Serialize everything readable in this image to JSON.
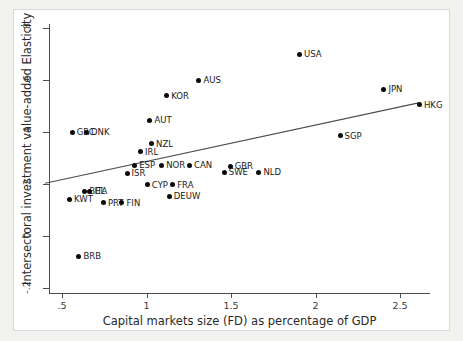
{
  "chart_data": {
    "type": "scatter",
    "title": "",
    "xlabel": "Capital markets size (FD) as percentage of GDP",
    "ylabel": "Intersectoral investment value-added Elasticity",
    "xlim": [
      0.37,
      2.72
    ],
    "ylim": [
      -0.24,
      0.84
    ],
    "xticks": [
      0.5,
      1,
      1.5,
      2,
      2.5
    ],
    "xticklabels": [
      ".5",
      "1",
      "1.5",
      "2",
      "2.5"
    ],
    "yticks": [
      -0.2,
      0,
      0.2,
      0.4,
      0.6,
      0.8
    ],
    "yticklabels": [
      "-.2",
      "0",
      ".2",
      ".4",
      ".6",
      ".8"
    ],
    "grid": false,
    "legend": false,
    "marker_color": "#0a0a0a",
    "fit_line_color": "#4d4d4d",
    "fit_line": {
      "x0": 0.4,
      "y0": 0.203,
      "x1": 2.61,
      "y1": 0.512
    },
    "points": [
      {
        "label": "GRC",
        "x": 0.56,
        "y": 0.4,
        "lx": "right"
      },
      {
        "label": "DNK",
        "x": 0.645,
        "y": 0.4,
        "lx": "right"
      },
      {
        "label": "AUS",
        "x": 1.31,
        "y": 0.6,
        "lx": "right"
      },
      {
        "label": "KOR",
        "x": 1.12,
        "y": 0.54,
        "lx": "right"
      },
      {
        "label": "AUT",
        "x": 1.02,
        "y": 0.445,
        "lx": "right"
      },
      {
        "label": "NZL",
        "x": 1.03,
        "y": 0.355,
        "lx": "right"
      },
      {
        "label": "IRL",
        "x": 0.965,
        "y": 0.325,
        "lx": "right"
      },
      {
        "label": "ESP",
        "x": 0.93,
        "y": 0.272,
        "lx": "right"
      },
      {
        "label": "NOR",
        "x": 1.09,
        "y": 0.272,
        "lx": "right"
      },
      {
        "label": "CAN",
        "x": 1.255,
        "y": 0.272,
        "lx": "right"
      },
      {
        "label": "GBR",
        "x": 1.495,
        "y": 0.268,
        "lx": "right"
      },
      {
        "label": "SWE",
        "x": 1.46,
        "y": 0.245,
        "lx": "right"
      },
      {
        "label": "NLD",
        "x": 1.665,
        "y": 0.245,
        "lx": "right"
      },
      {
        "label": "ISR",
        "x": 0.885,
        "y": 0.242,
        "lx": "right"
      },
      {
        "label": "CYP",
        "x": 1.005,
        "y": 0.198,
        "lx": "right"
      },
      {
        "label": "FRA",
        "x": 1.155,
        "y": 0.198,
        "lx": "right"
      },
      {
        "label": "DEUW",
        "x": 1.135,
        "y": 0.152,
        "lx": "right"
      },
      {
        "label": "BEL",
        "x": 0.635,
        "y": 0.172,
        "lx": "right"
      },
      {
        "label": "ITA",
        "x": 0.665,
        "y": 0.172,
        "lx": "right"
      },
      {
        "label": "KWT",
        "x": 0.545,
        "y": 0.142,
        "lx": "right"
      },
      {
        "label": "PRT",
        "x": 0.745,
        "y": 0.128,
        "lx": "right"
      },
      {
        "label": "FIN",
        "x": 0.855,
        "y": 0.128,
        "lx": "right"
      },
      {
        "label": "BRB",
        "x": 0.6,
        "y": -0.078,
        "lx": "right"
      },
      {
        "label": "USA",
        "x": 1.905,
        "y": 0.7,
        "lx": "right"
      },
      {
        "label": "JPN",
        "x": 2.405,
        "y": 0.565,
        "lx": "right"
      },
      {
        "label": "HKG",
        "x": 2.615,
        "y": 0.505,
        "lx": "right"
      },
      {
        "label": "SGP",
        "x": 2.145,
        "y": 0.385,
        "lx": "right"
      }
    ]
  }
}
